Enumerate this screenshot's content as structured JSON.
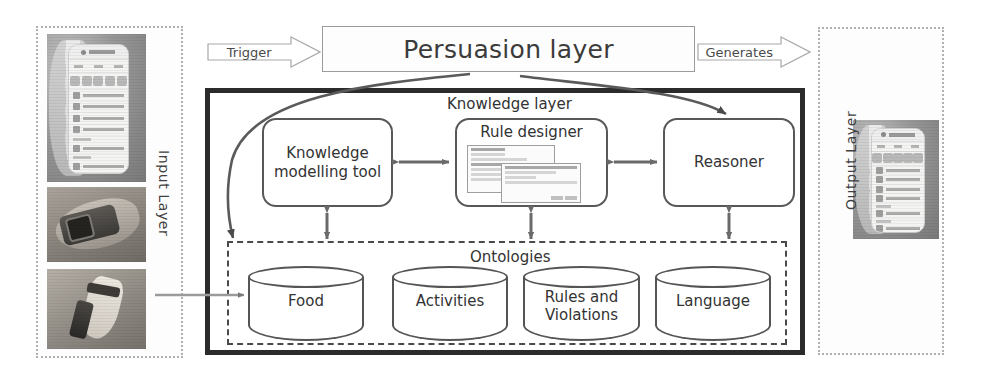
{
  "input_layer": {
    "label": "Input  Layer",
    "photos": [
      {
        "name": "smartphone-app-photo",
        "caption": ""
      },
      {
        "name": "smartwatch-wrist-photo",
        "caption": ""
      },
      {
        "name": "ankle-sensor-photo",
        "caption": ""
      }
    ]
  },
  "output_layer": {
    "label": "Output  Layer",
    "photos": [
      {
        "name": "smartphone-output-photo",
        "caption": ""
      }
    ]
  },
  "persuasion_layer": {
    "title": "Persuasion layer"
  },
  "arrows": {
    "trigger": "Trigger",
    "generates": "Generates"
  },
  "knowledge_layer": {
    "title": "Knowledge layer",
    "components": [
      {
        "id": "knowledge-modelling-tool",
        "label": "Knowledge\nmodelling tool",
        "line1": "Knowledge",
        "line2": "modelling tool"
      },
      {
        "id": "rule-designer",
        "label": "Rule designer",
        "line1": "Rule designer",
        "line2": ""
      },
      {
        "id": "reasoner",
        "label": "Reasoner",
        "line1": "Reasoner",
        "line2": ""
      }
    ]
  },
  "ontologies": {
    "title": "Ontologies",
    "stores": [
      {
        "id": "food",
        "line1": "Food",
        "line2": ""
      },
      {
        "id": "activities",
        "line1": "Activities",
        "line2": ""
      },
      {
        "id": "rules-and-violations",
        "line1": "Rules and",
        "line2": "Violations"
      },
      {
        "id": "language",
        "line1": "Language",
        "line2": ""
      }
    ]
  },
  "colors": {
    "knowledge_border": "#2b2b2b",
    "component_border": "#585858",
    "dotted_layer_border": "#b0b0b0",
    "text": "#333333",
    "arrow": "#6a6a6a"
  }
}
